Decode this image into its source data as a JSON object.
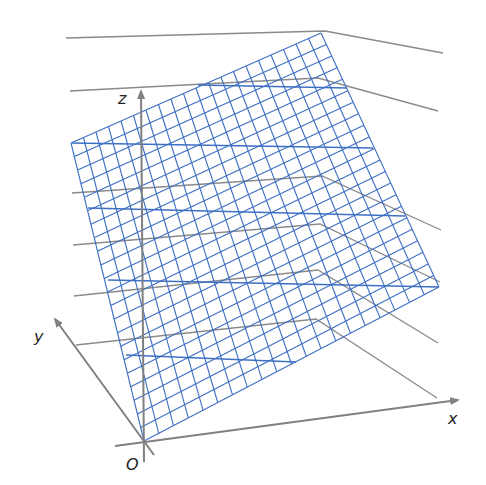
{
  "figure": {
    "width": 486,
    "height": 485,
    "background": "#ffffff"
  },
  "colors": {
    "grid": "#3d6fc4",
    "axis": "#808080",
    "guide": "#8a8a8a",
    "label": "#222222"
  },
  "axes": {
    "origin": {
      "label": "O",
      "x": 144,
      "y": 441,
      "label_x": 126,
      "label_y": 470
    },
    "x": {
      "label": "x",
      "tip": [
        458,
        400
      ],
      "start": [
        115,
        446
      ],
      "label_x": 448,
      "label_y": 424
    },
    "y": {
      "label": "y",
      "tip": [
        55,
        319
      ],
      "start": [
        154,
        455
      ],
      "label_x": 34,
      "label_y": 342
    },
    "z": {
      "label": "z",
      "tip": [
        141,
        91
      ],
      "start": [
        144,
        462
      ],
      "label_x": 118,
      "label_y": 104
    }
  },
  "surface": {
    "type": "mesh",
    "corners": {
      "left": [
        71,
        143
      ],
      "top": [
        321,
        33
      ],
      "right": [
        439,
        287
      ],
      "bottom": [
        144,
        441
      ]
    },
    "divisions_u": 20,
    "divisions_v": 22,
    "long_lines": [
      [
        [
          198,
          85
        ],
        [
          347,
          88
        ]
      ],
      [
        [
          72,
          143
        ],
        [
          373,
          148
        ]
      ],
      [
        [
          88,
          208
        ],
        [
          405,
          216
        ]
      ],
      [
        [
          108,
          280
        ],
        [
          439,
          287
        ]
      ],
      [
        [
          126,
          355
        ],
        [
          296,
          362
        ]
      ]
    ]
  },
  "guide_lines": [
    [
      [
        66,
        38
      ],
      [
        325,
        31
      ],
      [
        443,
        53
      ]
    ],
    [
      [
        70,
        91
      ],
      [
        318,
        78
      ],
      [
        438,
        111
      ]
    ],
    [
      [
        72,
        193
      ],
      [
        322,
        176
      ],
      [
        441,
        230
      ]
    ],
    [
      [
        73,
        245
      ],
      [
        320,
        224
      ],
      [
        440,
        282
      ]
    ],
    [
      [
        74,
        296
      ],
      [
        318,
        270
      ],
      [
        438,
        343
      ]
    ],
    [
      [
        76,
        345
      ],
      [
        316,
        319
      ],
      [
        437,
        398
      ]
    ]
  ]
}
